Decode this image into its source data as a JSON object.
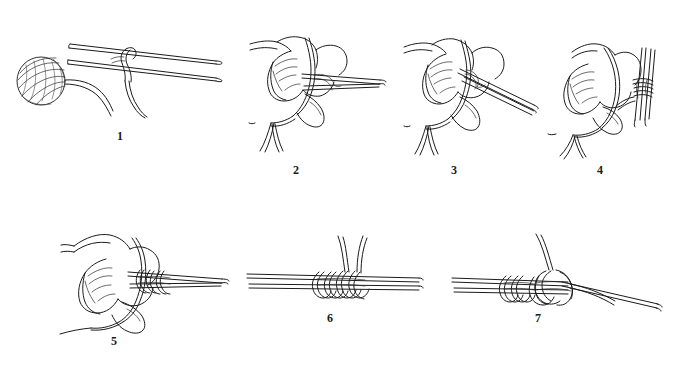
{
  "figure": {
    "background_color": "#ffffff",
    "ink_color": "#1b1b1b",
    "step_count": 7,
    "rows": 2,
    "medium": "pen and ink line drawing"
  },
  "steps": [
    {
      "number": "1",
      "caption": "1",
      "name": "slip-knot-on-needles",
      "description": "Ball of yarn at left with working strand leading to a slip knot looped over two parallel knitting needles; tail hangs down.",
      "elements": [
        "yarn-ball",
        "two-needles",
        "slip-knot-loop",
        "working-yarn",
        "yarn-tail"
      ]
    },
    {
      "number": "2",
      "caption": "2",
      "name": "hand-holding-needles-with-yarn",
      "description": "Left hand holds two needles; yarn passes over index finger and around thumb, two strands falling below the hand.",
      "elements": [
        "left-hand",
        "two-needles",
        "yarn-over-finger",
        "yarn-strands"
      ]
    },
    {
      "number": "3",
      "caption": "3",
      "name": "needle-tip-under-thumb-loop",
      "description": "Needle tips angle down to the right and are inserted under the loop of yarn held across the thumb.",
      "elements": [
        "left-hand",
        "two-needles",
        "thumb-loop",
        "yarn-strands"
      ]
    },
    {
      "number": "4",
      "caption": "4",
      "name": "yarn-wrapped-around-needles",
      "description": "Needles turned to vertical at the right of the hand with yarn wrapped around them forming the first stitches.",
      "elements": [
        "left-hand",
        "vertical-needles",
        "wrapped-yarn",
        "yarn-strands"
      ]
    },
    {
      "number": "5",
      "caption": "5",
      "name": "several-stitches-cast-on",
      "description": "Hand continues casting on; a short row of stitches now sits on the needles, working yarn looping down around the thumb.",
      "elements": [
        "left-hand",
        "two-needles",
        "cast-on-stitches",
        "working-yarn"
      ]
    },
    {
      "number": "6",
      "caption": "6",
      "name": "stitches-on-two-needles",
      "description": "Close-up of the two needles held together with a group of cast-on stitches; two yarn ends rise from the centre.",
      "elements": [
        "two-needles",
        "cast-on-stitches",
        "yarn-ends"
      ]
    },
    {
      "number": "7",
      "caption": "7",
      "name": "completed-cast-on-row",
      "description": "Close-up of the finished cast-on row with the last loop and working yarn at the right end of the needles.",
      "elements": [
        "two-needles",
        "cast-on-stitches",
        "last-loop",
        "working-yarn"
      ]
    }
  ]
}
